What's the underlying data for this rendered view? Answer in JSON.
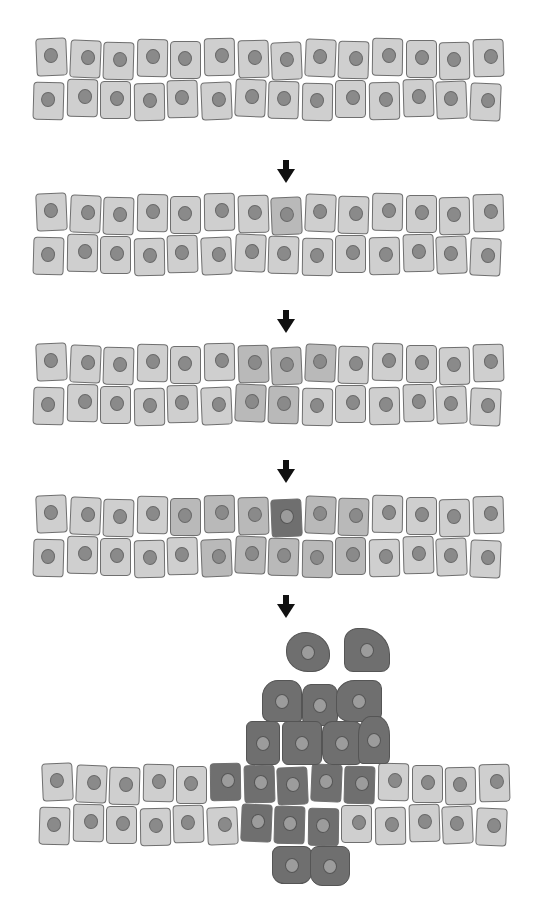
{
  "diagram": {
    "title": "",
    "colors": {
      "normal_cell": "#cfcfcf",
      "altered_cell": "#b9b9b9",
      "tumor_cell": "#6f6f6f",
      "nucleus": "#8a8a8a",
      "outline": "#6f6f6f",
      "arrow": "#111111"
    },
    "cells_per_row": 14,
    "stages": [
      {
        "id": 1,
        "label": "normal epithelium",
        "top": 40,
        "rows": [
          [
            0,
            0,
            0,
            0,
            0,
            0,
            0,
            0,
            0,
            0,
            0,
            0,
            0,
            0
          ],
          [
            0,
            0,
            0,
            0,
            0,
            0,
            0,
            0,
            0,
            0,
            0,
            0,
            0,
            0
          ]
        ]
      },
      {
        "id": 2,
        "label": "single mutated cell",
        "top": 195,
        "rows": [
          [
            0,
            0,
            0,
            0,
            0,
            0,
            0,
            1,
            0,
            0,
            0,
            0,
            0,
            0
          ],
          [
            0,
            0,
            0,
            0,
            0,
            0,
            0,
            0,
            0,
            0,
            0,
            0,
            0,
            0
          ]
        ]
      },
      {
        "id": 3,
        "label": "clonal expansion",
        "top": 345,
        "rows": [
          [
            0,
            0,
            0,
            0,
            0,
            0,
            1,
            1,
            1,
            0,
            0,
            0,
            0,
            0
          ],
          [
            0,
            0,
            0,
            0,
            0,
            0,
            1,
            1,
            0,
            0,
            0,
            0,
            0,
            0
          ]
        ]
      },
      {
        "id": 4,
        "label": "second mutation within clone",
        "top": 497,
        "rows": [
          [
            0,
            0,
            0,
            0,
            1,
            1,
            1,
            2,
            1,
            1,
            0,
            0,
            0,
            0
          ],
          [
            0,
            0,
            0,
            0,
            0,
            1,
            1,
            1,
            1,
            1,
            0,
            0,
            0,
            0
          ]
        ]
      },
      {
        "id": 5,
        "label": "invasive tumor",
        "top": 765,
        "rows": [
          [
            0,
            0,
            0,
            0,
            0,
            2,
            2,
            2,
            2,
            2,
            0,
            0,
            0,
            0
          ],
          [
            0,
            0,
            0,
            0,
            0,
            0,
            2,
            2,
            2,
            0,
            0,
            0,
            0,
            0
          ]
        ]
      }
    ],
    "arrows": [
      {
        "x": 286,
        "y": 160
      },
      {
        "x": 286,
        "y": 310
      },
      {
        "x": 286,
        "y": 460
      },
      {
        "x": 286,
        "y": 595
      }
    ],
    "loose_tumor_cells": [
      {
        "x": 286,
        "y": 632,
        "w": 44,
        "h": 40,
        "r": "45% 55% 40% 50%"
      },
      {
        "x": 344,
        "y": 628,
        "w": 46,
        "h": 44,
        "r": "30% 60% 20% 20%"
      },
      {
        "x": 262,
        "y": 680,
        "w": 40,
        "h": 42,
        "r": "40% 30% 10% 20%"
      },
      {
        "x": 302,
        "y": 684,
        "w": 36,
        "h": 42,
        "r": "25% 25% 20% 20%"
      },
      {
        "x": 336,
        "y": 680,
        "w": 46,
        "h": 42,
        "r": "40% 20% 20% 30%"
      },
      {
        "x": 246,
        "y": 721,
        "w": 34,
        "h": 44,
        "r": "6px"
      },
      {
        "x": 282,
        "y": 721,
        "w": 40,
        "h": 44,
        "r": "6px"
      },
      {
        "x": 322,
        "y": 721,
        "w": 40,
        "h": 44,
        "r": "25% 20% 15% 25%"
      },
      {
        "x": 358,
        "y": 716,
        "w": 32,
        "h": 48,
        "r": "40% 40% 15% 15%"
      },
      {
        "x": 272,
        "y": 846,
        "w": 40,
        "h": 38,
        "r": "20% 20% 30% 30%"
      },
      {
        "x": 310,
        "y": 846,
        "w": 40,
        "h": 40,
        "r": "20% 20% 30% 30%"
      }
    ]
  }
}
